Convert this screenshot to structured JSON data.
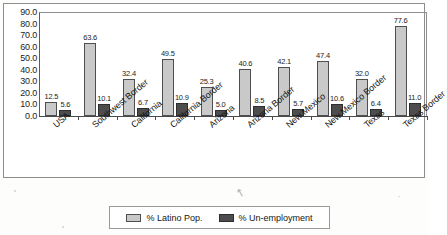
{
  "chart_data": {
    "type": "bar",
    "title": "",
    "subtitle": "",
    "xlabel": "",
    "ylabel": "",
    "ylim": [
      0,
      90
    ],
    "y_ticks": [
      "0.0",
      "10.0",
      "20.0",
      "30.0",
      "40.0",
      "50.0",
      "60.0",
      "70.0",
      "80.0",
      "90.0"
    ],
    "y_tick_step": 10,
    "grid": false,
    "legend_position": "bottom",
    "categories": [
      "USA",
      "Southwest Border",
      "California",
      "California Border",
      "Arizona",
      "Arizona Border",
      "New Mexico",
      "New Mexico Border",
      "Texas",
      "Texas Border"
    ],
    "series": [
      {
        "name": "% Latino Pop.",
        "color": "#c9c9c9",
        "values": [
          12.5,
          63.6,
          32.4,
          49.5,
          25.3,
          40.6,
          42.1,
          47.4,
          32.0,
          77.6
        ],
        "labels": [
          "12.5",
          "63.6",
          "32.4",
          "49.5",
          "25.3",
          "40.6",
          "42.1",
          "47.4",
          "32.0",
          "77.6"
        ]
      },
      {
        "name": "% Un-employment",
        "color": "#4d4d4d",
        "values": [
          5.6,
          10.1,
          6.7,
          10.9,
          5.0,
          8.5,
          5.7,
          10.6,
          6.4,
          11.0
        ],
        "labels": [
          "5.6",
          "10.1",
          "6.7",
          "10.9",
          "5.0",
          "8.5",
          "5.7",
          "10.6",
          "6.4",
          "11.0"
        ]
      }
    ]
  },
  "legend": {
    "entries": [
      {
        "label": "% Latino Pop."
      },
      {
        "label": "% Un-employment"
      }
    ]
  },
  "icons": {
    "cursor": "↖"
  }
}
